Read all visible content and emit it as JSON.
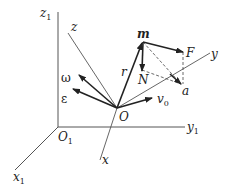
{
  "diagram": {
    "type": "kinematics-coordinate-frames",
    "fixed_frame": {
      "origin_label": "O",
      "origin_subscript": "1",
      "axes": [
        {
          "label": "x",
          "subscript": "1"
        },
        {
          "label": "y",
          "subscript": "1"
        },
        {
          "label": "z",
          "subscript": "1"
        }
      ]
    },
    "moving_frame": {
      "origin_label": "O",
      "axes": [
        {
          "label": "x"
        },
        {
          "label": "y"
        },
        {
          "label": "z"
        }
      ]
    },
    "vectors": [
      {
        "label": "ω",
        "meaning": "angular velocity"
      },
      {
        "label": "ε",
        "meaning": "angular acceleration"
      },
      {
        "label": "v",
        "subscript": "0",
        "meaning": "origin velocity"
      },
      {
        "label": "r",
        "meaning": "position vector"
      },
      {
        "label": "F",
        "meaning": "force"
      },
      {
        "label": "N",
        "meaning": "reaction force"
      },
      {
        "label": "a",
        "meaning": "acceleration"
      }
    ],
    "point_label": "m",
    "colors": {
      "line": "#333333",
      "axis": "#555555",
      "dashed": "#444444"
    }
  }
}
